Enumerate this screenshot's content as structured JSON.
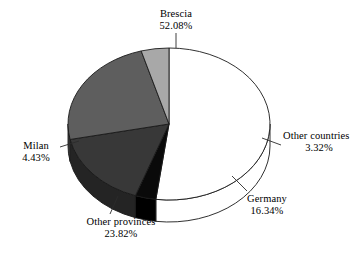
{
  "chart_data": {
    "type": "pie",
    "title": "",
    "subtitle": "",
    "xlabel": "",
    "ylabel": "",
    "legend_position": "none",
    "grid": false,
    "labels_inline": true,
    "units": "%",
    "three_d": true,
    "start_angle_deg": 0,
    "direction": "clockwise",
    "categories": [
      "Brescia",
      "Other countries",
      "Germany",
      "Other provinces",
      "Milan"
    ],
    "values": [
      52.08,
      3.32,
      16.34,
      23.82,
      4.43
    ],
    "slices": [
      {
        "name": "Brescia",
        "value": 52.08,
        "value_text": "52.08%",
        "color": "#ffffff",
        "side_color": "#ffffff",
        "start_deg": 0,
        "end_deg": 187.49
      },
      {
        "name": "Other countries",
        "value": 3.32,
        "value_text": "3.32%",
        "color": "#0a0a0a",
        "side_color": "#000000",
        "start_deg": 187.49,
        "end_deg": 199.44
      },
      {
        "name": "Germany",
        "value": 16.34,
        "value_text": "16.34%",
        "color": "#383838",
        "side_color": "#242424",
        "start_deg": 199.44,
        "end_deg": 258.26
      },
      {
        "name": "Other provinces",
        "value": 23.82,
        "value_text": "23.82%",
        "color": "#5e5e5e",
        "side_color": "#3f3f3f",
        "start_deg": 258.26,
        "end_deg": 344.01
      },
      {
        "name": "Milan",
        "value": 4.43,
        "value_text": "4.43%",
        "color": "#a8a8a8",
        "side_color": "#8a8a8a",
        "start_deg": 344.01,
        "end_deg": 360
      }
    ]
  },
  "labels": {
    "brescia": {
      "name": "Brescia",
      "percent": "52.08%"
    },
    "other_countries": {
      "name": "Other countries",
      "percent": "3.32%"
    },
    "germany": {
      "name": "Germany",
      "percent": "16.34%"
    },
    "other_provinces": {
      "name": "Other provinces",
      "percent": "23.82%"
    },
    "milan": {
      "name": "Milan",
      "percent": "4.43%"
    }
  },
  "colors": {
    "background": "#ffffff",
    "outline": "#1a1a1a",
    "text": "#000000",
    "leader_line": "#2b2b2b"
  }
}
